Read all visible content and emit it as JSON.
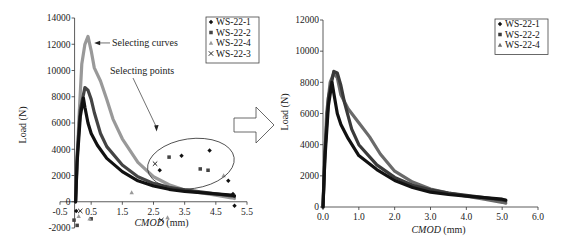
{
  "chart_data": [
    {
      "id": "left",
      "type": "scatter",
      "title": "",
      "xlabel_italic": "CMOD",
      "xlabel_unit": " (mm)",
      "ylabel": "Load (N)",
      "xlim": [
        -0.5,
        5.5
      ],
      "ylim": [
        -2000,
        14000
      ],
      "xticks": [
        -0.5,
        0.5,
        1.5,
        2.5,
        3.5,
        4.5,
        5.5
      ],
      "xtick_labels": [
        "-0.5",
        "0.5",
        "1.5",
        "2.5",
        "3.5",
        "4.5",
        "5.5"
      ],
      "yticks": [
        -2000,
        0,
        2000,
        4000,
        6000,
        8000,
        10000,
        12000,
        14000
      ],
      "ytick_labels": [
        "-2000",
        "0",
        "2000",
        "4000",
        "6000",
        "8000",
        "10000",
        "12000",
        "14000"
      ],
      "legend_position": "top-right",
      "series": [
        {
          "name": "WS-22-1",
          "marker": "diamond",
          "color": "#111111",
          "curve": [
            [
              0,
              0
            ],
            [
              0.05,
              3000
            ],
            [
              0.15,
              6500
            ],
            [
              0.25,
              7900
            ],
            [
              0.3,
              7200
            ],
            [
              0.4,
              6000
            ],
            [
              0.5,
              5200
            ],
            [
              0.7,
              4300
            ],
            [
              1.0,
              3300
            ],
            [
              1.5,
              2300
            ],
            [
              2.0,
              1600
            ],
            [
              2.5,
              1200
            ],
            [
              3.0,
              950
            ],
            [
              3.5,
              800
            ],
            [
              4.0,
              700
            ],
            [
              4.5,
              600
            ],
            [
              5.0,
              500
            ],
            [
              5.1,
              450
            ]
          ],
          "outliers": [
            [
              2.7,
              2400
            ],
            [
              3.4,
              3500
            ],
            [
              4.3,
              3900
            ],
            [
              4.9,
              1600
            ],
            [
              5.05,
              600
            ],
            [
              5.1,
              -300
            ],
            [
              0.02,
              -700
            ]
          ]
        },
        {
          "name": "WS-22-2",
          "marker": "square",
          "color": "#444444",
          "curve": [
            [
              0,
              0
            ],
            [
              0.05,
              3500
            ],
            [
              0.15,
              7000
            ],
            [
              0.3,
              8700
            ],
            [
              0.4,
              8500
            ],
            [
              0.5,
              7800
            ],
            [
              0.6,
              6800
            ],
            [
              0.8,
              5200
            ],
            [
              1.0,
              4200
            ],
            [
              1.5,
              2800
            ],
            [
              2.0,
              1900
            ],
            [
              2.5,
              1400
            ],
            [
              3.0,
              1100
            ],
            [
              3.5,
              900
            ],
            [
              4.0,
              750
            ],
            [
              4.5,
              600
            ],
            [
              5.0,
              450
            ],
            [
              5.1,
              400
            ]
          ],
          "outliers": [
            [
              3.0,
              3400
            ],
            [
              4.0,
              2500
            ],
            [
              4.25,
              2400
            ],
            [
              0.5,
              -1300
            ],
            [
              0.05,
              -1800
            ],
            [
              -0.05,
              -1400
            ]
          ]
        },
        {
          "name": "WS-22-4",
          "marker": "triangle",
          "color": "#999999",
          "curve": [
            [
              0,
              0
            ],
            [
              0.1,
              6000
            ],
            [
              0.2,
              10500
            ],
            [
              0.3,
              12000
            ],
            [
              0.4,
              12600
            ],
            [
              0.5,
              11500
            ],
            [
              0.6,
              10200
            ],
            [
              0.8,
              9200
            ],
            [
              1.0,
              7800
            ],
            [
              1.2,
              6300
            ],
            [
              1.5,
              4800
            ],
            [
              2.0,
              3000
            ],
            [
              2.5,
              1900
            ],
            [
              3.0,
              1300
            ],
            [
              3.5,
              900
            ],
            [
              4.0,
              700
            ],
            [
              4.5,
              500
            ],
            [
              5.0,
              300
            ],
            [
              5.1,
              250
            ]
          ],
          "outliers": [
            [
              1.8,
              700
            ],
            [
              4.75,
              2000
            ],
            [
              0.1,
              -1100
            ],
            [
              0.45,
              -1300
            ],
            [
              2.95,
              -1200
            ]
          ]
        },
        {
          "name": "WS-22-3",
          "marker": "x",
          "color": "#222222",
          "curve": [],
          "outliers": [
            [
              2.55,
              2900
            ],
            [
              0.15,
              -700
            ],
            [
              2.75,
              -1400
            ]
          ]
        }
      ],
      "annotations": [
        {
          "text": "Selecting curves",
          "points_to": [
            0.5,
            12100
          ]
        },
        {
          "text": "Selecting points",
          "points_to": [
            2.6,
            5500
          ]
        }
      ],
      "ellipse_region": {
        "x_range": [
          2.3,
          5.1
        ],
        "y_range": [
          1000,
          4800
        ]
      }
    },
    {
      "id": "right",
      "type": "scatter",
      "title": "",
      "xlabel_italic": "CMOD",
      "xlabel_unit": " (mm)",
      "ylabel": "Load (N)",
      "xlim": [
        0,
        6
      ],
      "ylim": [
        0,
        12000
      ],
      "xticks": [
        0,
        1,
        2,
        3,
        4,
        5,
        6
      ],
      "xtick_labels": [
        "0.0",
        "1.0",
        "2.0",
        "3.0",
        "4.0",
        "5.0",
        "6.0"
      ],
      "yticks": [
        0,
        2000,
        4000,
        6000,
        8000,
        10000,
        12000
      ],
      "ytick_labels": [
        "0",
        "2000",
        "4000",
        "6000",
        "8000",
        "10000",
        "12000"
      ],
      "legend_position": "top-right",
      "series": [
        {
          "name": "WS-22-1",
          "marker": "diamond",
          "color": "#111111",
          "curve": [
            [
              0,
              0
            ],
            [
              0.05,
              3000
            ],
            [
              0.15,
              6500
            ],
            [
              0.25,
              8000
            ],
            [
              0.3,
              7300
            ],
            [
              0.4,
              6000
            ],
            [
              0.5,
              5300
            ],
            [
              0.7,
              4400
            ],
            [
              1.0,
              3300
            ],
            [
              1.5,
              2400
            ],
            [
              2.0,
              1700
            ],
            [
              2.5,
              1250
            ],
            [
              3.0,
              950
            ],
            [
              3.5,
              800
            ],
            [
              4.0,
              700
            ],
            [
              4.5,
              600
            ],
            [
              5.0,
              500
            ],
            [
              5.1,
              450
            ]
          ]
        },
        {
          "name": "WS-22-2",
          "marker": "square",
          "color": "#3a3a3a",
          "curve": [
            [
              0,
              0
            ],
            [
              0.05,
              3500
            ],
            [
              0.15,
              7000
            ],
            [
              0.3,
              8700
            ],
            [
              0.4,
              8600
            ],
            [
              0.5,
              7800
            ],
            [
              0.6,
              6700
            ],
            [
              0.8,
              5000
            ],
            [
              1.0,
              4000
            ],
            [
              1.5,
              2700
            ],
            [
              2.0,
              1900
            ],
            [
              2.5,
              1400
            ],
            [
              3.0,
              1100
            ],
            [
              3.5,
              900
            ],
            [
              4.0,
              750
            ],
            [
              4.5,
              600
            ],
            [
              5.0,
              450
            ],
            [
              5.1,
              400
            ]
          ]
        },
        {
          "name": "WS-22-4",
          "marker": "triangle",
          "color": "#6a6a6a",
          "curve": [
            [
              0,
              0
            ],
            [
              0.1,
              6000
            ],
            [
              0.2,
              8000
            ],
            [
              0.3,
              8600
            ],
            [
              0.4,
              8300
            ],
            [
              0.5,
              7200
            ],
            [
              0.7,
              6300
            ],
            [
              1.0,
              5400
            ],
            [
              1.3,
              4500
            ],
            [
              1.6,
              3400
            ],
            [
              2.0,
              2300
            ],
            [
              2.5,
              1600
            ],
            [
              3.0,
              1150
            ],
            [
              3.5,
              900
            ],
            [
              4.0,
              700
            ],
            [
              4.5,
              500
            ],
            [
              5.0,
              300
            ],
            [
              5.1,
              250
            ]
          ]
        }
      ]
    }
  ],
  "transition_arrow": {
    "icon": "right-arrow-icon",
    "direction": "right"
  }
}
